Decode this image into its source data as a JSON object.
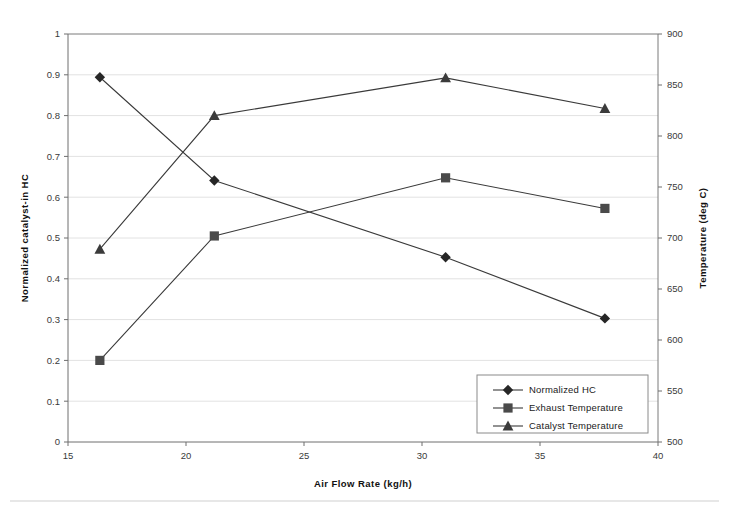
{
  "chart_data": {
    "type": "line",
    "title": "",
    "xlabel": "Air Flow Rate (kg/h)",
    "ylabel": "Normalized catalyst-in HC",
    "y2label": "Temperature (deg C)",
    "xlim": [
      15,
      40
    ],
    "ylim": [
      0,
      1
    ],
    "y2lim": [
      500,
      900
    ],
    "xticks": [
      "15",
      "20",
      "25",
      "30",
      "35",
      "40"
    ],
    "xtick_values": [
      15,
      20,
      25,
      30,
      35,
      40
    ],
    "yticks": [
      "0",
      "0.1",
      "0.2",
      "0.3",
      "0.4",
      "0.5",
      "0.6",
      "0.7",
      "0.8",
      "0.9",
      "1"
    ],
    "ytick_values": [
      0,
      0.1,
      0.2,
      0.3,
      0.4,
      0.5,
      0.6,
      0.7,
      0.8,
      0.9,
      1
    ],
    "y2ticks": [
      "500",
      "550",
      "600",
      "650",
      "700",
      "750",
      "800",
      "850",
      "900"
    ],
    "y2tick_values": [
      500,
      550,
      600,
      650,
      700,
      750,
      800,
      850,
      900
    ],
    "grid": true,
    "legend_position": "inside-lower-right",
    "x": [
      16.35,
      21.2,
      31.0,
      37.75
    ],
    "series": [
      {
        "name": "Normalized HC",
        "marker": "diamond",
        "axis": "left",
        "values": [
          0.894,
          0.641,
          0.453,
          0.303
        ]
      },
      {
        "name": "Exhaust Temperature",
        "marker": "square",
        "axis": "right",
        "values": [
          580,
          702,
          759,
          729
        ],
        "normalized_values": [
          0.199,
          0.505,
          0.647,
          0.573
        ]
      },
      {
        "name": "Catalyst Temperature",
        "marker": "triangle",
        "axis": "right",
        "values": [
          689,
          820,
          857,
          827
        ],
        "normalized_values": [
          0.472,
          0.8,
          0.892,
          0.818
        ]
      }
    ]
  },
  "legend": {
    "entries": [
      {
        "label": "Normalized HC",
        "marker": "diamond"
      },
      {
        "label": "Exhaust Temperature",
        "marker": "square"
      },
      {
        "label": "Catalyst Temperature",
        "marker": "triangle"
      }
    ]
  },
  "colors": {
    "series_line": "#3a3a3a",
    "grid": "#e2e2e2",
    "frame": "#7a7a7a",
    "text": "#1a1a1a",
    "background": "#ffffff"
  }
}
